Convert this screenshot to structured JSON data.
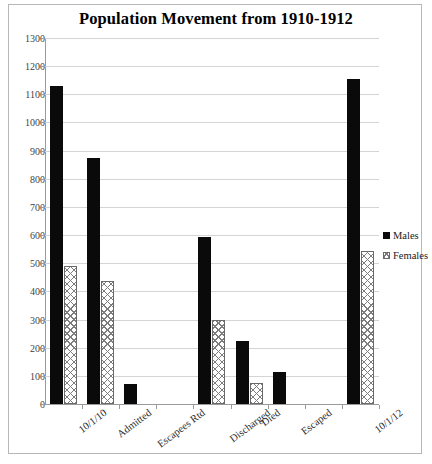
{
  "chart_data": {
    "type": "bar",
    "title": "Population Movement from 1910-1912",
    "xlabel": "",
    "ylabel": "",
    "ylim": [
      0,
      1300
    ],
    "ytick_step": 100,
    "yticks": [
      0,
      100,
      200,
      300,
      400,
      500,
      600,
      700,
      800,
      900,
      1000,
      1100,
      1200,
      1300
    ],
    "grid": true,
    "legend_position": "right",
    "categories": [
      "10/1/10",
      "Admitted",
      "Escapees Rtd",
      "",
      "Discharged",
      "Died",
      "Escaped",
      "",
      "10/1/12"
    ],
    "series": [
      {
        "name": "Males",
        "color": "#0a0a0a",
        "values": [
          1130,
          875,
          70,
          0,
          595,
          225,
          115,
          0,
          1153
        ]
      },
      {
        "name": "Females",
        "color": "#7d7d7d",
        "pattern": "crosshatch",
        "values": [
          490,
          437,
          0,
          0,
          300,
          75,
          0,
          0,
          545
        ]
      }
    ]
  },
  "legend": {
    "items": [
      {
        "label": "Males",
        "swatch": "males-swatch"
      },
      {
        "label": "Females",
        "swatch": "females-swatch"
      }
    ]
  }
}
